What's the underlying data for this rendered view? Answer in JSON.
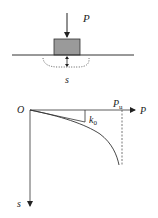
{
  "figure": {
    "top_diagram": {
      "description": "Plate load test: rigid block on ground under load P with settlement s",
      "labels": {
        "load": "P",
        "settlement": "s"
      },
      "colors": {
        "block_fill": "#9a9a9a",
        "line": "#222222"
      }
    },
    "bottom_diagram": {
      "description": "Load-settlement (P-s) curve",
      "labels": {
        "origin": "O",
        "x_axis": "P",
        "y_axis": "s",
        "ultimate_load": "P",
        "ultimate_load_sub": "u",
        "initial_stiffness": "k",
        "initial_stiffness_sub": "0"
      }
    }
  }
}
